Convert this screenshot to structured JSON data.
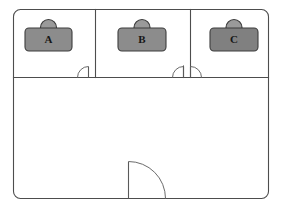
{
  "diagram": {
    "type": "floor-plan",
    "canvas": {
      "width": 281,
      "height": 208
    },
    "colors": {
      "background": "#ffffff",
      "wall_stroke": "#4d4d4d",
      "door_stroke": "#6b6b6b",
      "desk_fill": "#8c8c8c",
      "desk_fill_dark": "#808080",
      "desk_stroke": "#3c3c3c",
      "chair_fill": "#9a9a9a",
      "label_color": "#161616"
    },
    "outer_wall": {
      "name": "building-outline",
      "x": 13,
      "y": 9,
      "width": 256,
      "height": 190,
      "corner_radius": 7
    },
    "partitions": [
      {
        "name": "horizontal-divider",
        "orientation": "horizontal",
        "x1": 13,
        "y1": 77,
        "x2": 269,
        "y2": 77
      },
      {
        "name": "vertical-wall-a-b",
        "orientation": "vertical",
        "x1": 95,
        "y1": 9,
        "x2": 95,
        "y2": 77
      },
      {
        "name": "vertical-wall-b-c",
        "orientation": "vertical",
        "x1": 190,
        "y1": 9,
        "x2": 190,
        "y2": 77
      },
      {
        "name": "door-jamb-b-right",
        "orientation": "vertical",
        "x1": 183,
        "y1": 66,
        "x2": 183,
        "y2": 77
      }
    ],
    "rooms": [
      {
        "name": "room-a",
        "label": "A",
        "x": 13,
        "y": 9,
        "width": 82,
        "height": 68
      },
      {
        "name": "room-b",
        "label": "B",
        "x": 95,
        "y": 9,
        "width": 95,
        "height": 68
      },
      {
        "name": "room-c",
        "label": "C",
        "x": 190,
        "y": 9,
        "width": 79,
        "height": 68
      },
      {
        "name": "room-common",
        "label": "",
        "x": 13,
        "y": 77,
        "width": 256,
        "height": 122
      }
    ],
    "desks": [
      {
        "name": "desk-a",
        "label": "A",
        "x": 25,
        "y": 28,
        "width": 47,
        "height": 23,
        "corner_radius": 4,
        "label_x": 48.5,
        "label_y": 41,
        "chair": {
          "cx": 48.5,
          "cy": 27.5,
          "r": 8.5
        },
        "fill": "#8c8c8c"
      },
      {
        "name": "desk-b",
        "label": "B",
        "x": 118,
        "y": 28,
        "width": 48,
        "height": 23,
        "corner_radius": 4,
        "label_x": 142,
        "label_y": 41,
        "chair": {
          "cx": 142,
          "cy": 27.5,
          "r": 8.5
        },
        "fill": "#8c8c8c"
      },
      {
        "name": "desk-c",
        "label": "C",
        "x": 210,
        "y": 28,
        "width": 48,
        "height": 23,
        "corner_radius": 4,
        "label_x": 234,
        "label_y": 41,
        "chair": {
          "cx": 234,
          "cy": 27.5,
          "r": 8.5
        },
        "fill": "#808080"
      }
    ],
    "doors": [
      {
        "name": "door-room-a",
        "hinge_x": 88,
        "hinge_y": 77,
        "swing": "left-up",
        "width": 11,
        "leaf": "M 88 77 L 88 66",
        "arc": "M 88 66 A 11 11 0 0 0 77 77"
      },
      {
        "name": "door-room-b",
        "hinge_x": 183,
        "hinge_y": 77,
        "swing": "left-up",
        "width": 11,
        "leaf": "M 183 77 L 183 66",
        "arc": "M 183 66 A 11 11 0 0 0 172 77"
      },
      {
        "name": "door-room-c",
        "hinge_x": 190,
        "hinge_y": 77,
        "swing": "right-up",
        "width": 11,
        "leaf": "M 190 77 L 190 66",
        "arc": "M 190 66 A 11 11 0 0 1 201 77"
      },
      {
        "name": "door-entrance",
        "hinge_x": 128,
        "hinge_y": 199,
        "swing": "right-up",
        "width": 37,
        "leaf": "M 128 199 L 128 162",
        "arc": "M 128 162 A 37 37 0 0 1 165 199"
      }
    ]
  }
}
